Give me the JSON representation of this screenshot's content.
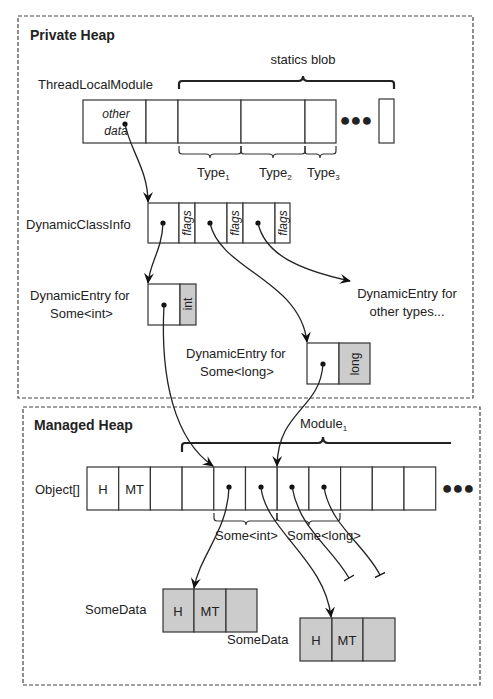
{
  "private_heap": {
    "title": "Private Heap",
    "thread_local_module": {
      "label": "ThreadLocalModule",
      "cell1_line1": "other",
      "cell1_line2": "data",
      "statics_blob_label": "statics blob",
      "ellipsis": "●●●",
      "types": [
        {
          "name": "Type",
          "sub": "1"
        },
        {
          "name": "Type",
          "sub": "2"
        },
        {
          "name": "Type",
          "sub": "3"
        }
      ]
    },
    "dynamic_class_info": {
      "label": "DynamicClassInfo",
      "flags": [
        "flags",
        "flags",
        "flags"
      ]
    },
    "dynamic_entry_int": {
      "line1": "DynamicEntry for",
      "line2": "Some<int>",
      "type_tag": "int"
    },
    "dynamic_entry_long": {
      "line1": "DynamicEntry for",
      "line2": "Some<long>",
      "type_tag": "long"
    },
    "dynamic_entry_other": {
      "line1": "DynamicEntry for",
      "line2": "other types..."
    }
  },
  "managed_heap": {
    "title": "Managed Heap",
    "module_label": "Module",
    "module_sub": "1",
    "object_array": {
      "label": "Object[]",
      "cells": [
        "H",
        "MT",
        "",
        "",
        "",
        "",
        "",
        "",
        "",
        "",
        ""
      ],
      "ellipsis": "●●●"
    },
    "some_int_label": "Some<int>",
    "some_long_label": "Some<long>",
    "some_data_1": {
      "label": "SomeData",
      "cells": [
        "H",
        "MT",
        ""
      ]
    },
    "some_data_2": {
      "label": "SomeData",
      "cells": [
        "H",
        "MT",
        ""
      ]
    }
  },
  "colors": {
    "cell_fill": "#ffffff",
    "shaded_fill": "#cccccc",
    "stroke": "#333333"
  }
}
